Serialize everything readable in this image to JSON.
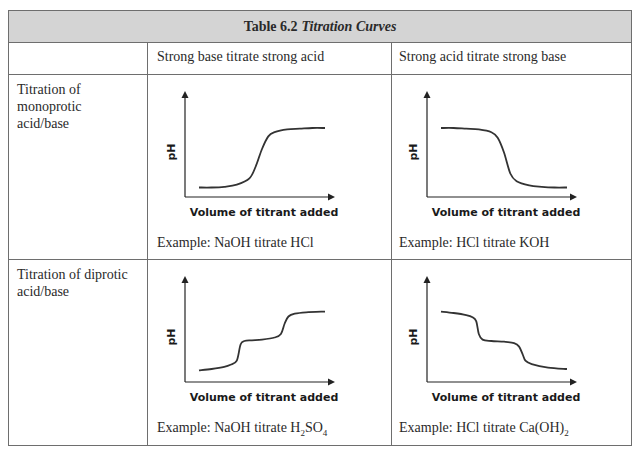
{
  "table": {
    "title_bold": "Table 6.2",
    "title_italic": "Titration Curves",
    "header_bg": "#d4d4d4",
    "border_color": "#6e6e6e",
    "columns": [
      "",
      "Strong base titrate strong acid",
      "Strong acid titrate strong base"
    ],
    "rows": [
      {
        "label": [
          "Titration of",
          "monoprotic",
          "acid/base"
        ],
        "cells": [
          {
            "example": "Example: NaOH titrate HCl",
            "plot_index": 0
          },
          {
            "example": "Example: HCl titrate KOH",
            "plot_index": 1
          }
        ]
      },
      {
        "label": [
          "Titration of diprotic",
          "acid/base"
        ],
        "cells": [
          {
            "example_pre": "Example: NaOH titrate H",
            "example_sub1": "2",
            "example_mid": "SO",
            "example_sub2": "4",
            "plot_index": 2
          },
          {
            "example_pre": "Example: HCl titrate Ca(OH)",
            "example_sub1": "2",
            "plot_index": 3
          }
        ]
      }
    ]
  },
  "chart_data": [
    {
      "type": "line",
      "title": "Strong base titrate strong acid (monoprotic)",
      "xlabel": "Volume of titrant added",
      "ylabel": "pH",
      "x": [
        0,
        10,
        20,
        30,
        40,
        45,
        50,
        55,
        60,
        70,
        80,
        90,
        100
      ],
      "values": [
        5,
        5,
        6,
        9,
        18,
        35,
        60,
        78,
        84,
        88,
        89,
        90,
        90
      ]
    },
    {
      "type": "line",
      "title": "Strong acid titrate strong base (monoprotic)",
      "xlabel": "Volume of titrant added",
      "ylabel": "pH",
      "x": [
        0,
        10,
        20,
        30,
        40,
        45,
        50,
        55,
        60,
        70,
        80,
        90,
        100
      ],
      "values": [
        90,
        90,
        89,
        88,
        84,
        76,
        55,
        25,
        14,
        8,
        6,
        5,
        5
      ]
    },
    {
      "type": "line",
      "title": "Strong base titrate strong acid (diprotic)",
      "xlabel": "Volume of titrant added",
      "ylabel": "pH",
      "x": [
        0,
        10,
        20,
        25,
        30,
        33,
        36,
        42,
        50,
        60,
        65,
        68,
        71,
        76,
        85,
        100
      ],
      "values": [
        8,
        10,
        13,
        16,
        22,
        45,
        50,
        51,
        52,
        55,
        60,
        75,
        85,
        89,
        91,
        92
      ]
    },
    {
      "type": "line",
      "title": "Strong acid titrate strong base (diprotic)",
      "xlabel": "Volume of titrant added",
      "ylabel": "pH",
      "x": [
        0,
        10,
        20,
        25,
        28,
        30,
        33,
        40,
        50,
        58,
        62,
        65,
        67,
        72,
        85,
        100
      ],
      "values": [
        92,
        90,
        87,
        84,
        78,
        60,
        52,
        50,
        49,
        47,
        42,
        30,
        22,
        17,
        12,
        10
      ]
    }
  ]
}
